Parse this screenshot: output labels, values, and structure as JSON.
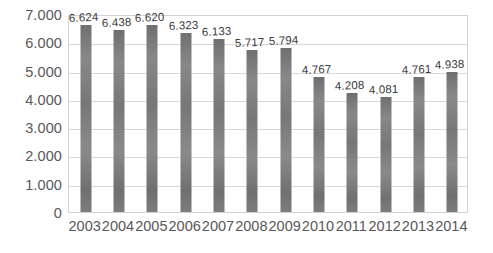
{
  "chart_data": {
    "type": "bar",
    "title": "",
    "subtitle": "",
    "xlabel": "",
    "ylabel": "",
    "categories": [
      "2003",
      "2004",
      "2005",
      "2006",
      "2007",
      "2008",
      "2009",
      "2010",
      "2011",
      "2012",
      "2013",
      "2014"
    ],
    "values": [
      6.624,
      6.438,
      6.62,
      6.323,
      6.133,
      5.717,
      5.794,
      4.767,
      4.208,
      4.081,
      4.761,
      4.938
    ],
    "data_labels": [
      "6.624",
      "6.438",
      "6.620",
      "6.323",
      "6.133",
      "5.717",
      "5.794",
      "4.767",
      "4.208",
      "4.081",
      "4.761",
      "4.938"
    ],
    "ylim": [
      0,
      7000
    ],
    "ytick_values": [
      0,
      1000,
      2000,
      3000,
      4000,
      5000,
      6000,
      7000
    ],
    "ytick_labels": [
      "0",
      "1.000",
      "2.000",
      "3.000",
      "4.000",
      "5.000",
      "6.000",
      "7.000"
    ],
    "grid": "horizontal",
    "legend": "none",
    "series": [
      {
        "name": "",
        "color": "#7c7c7e",
        "values": [
          6.624,
          6.438,
          6.62,
          6.323,
          6.133,
          5.717,
          5.794,
          4.767,
          4.208,
          4.081,
          4.761,
          4.938
        ]
      }
    ]
  },
  "style": {
    "bar_color": "#7c7c7e",
    "gridline_color": "#d8d8d8",
    "plot_border_color": "#d2d2d2",
    "axis_text_color": "#59585a",
    "label_text_color": "#3a393b",
    "background_color": "#ffffff"
  }
}
